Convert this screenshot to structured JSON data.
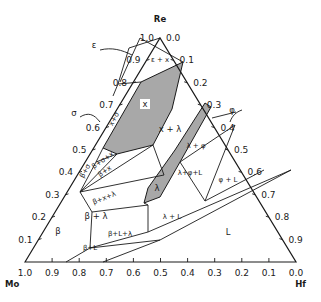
{
  "diagram": {
    "vertices": {
      "top": {
        "label": "Re",
        "x": 160,
        "y": 38
      },
      "left": {
        "label": "Mo",
        "x": 25,
        "y": 262
      },
      "right": {
        "label": "Hf",
        "x": 296,
        "y": 262
      }
    },
    "left_axis_ticks": [
      "1.0",
      "0.9",
      "0.8",
      "0.7",
      "0.6",
      "0.5",
      "0.4",
      "0.3",
      "0.2",
      "0.1"
    ],
    "right_axis_ticks": [
      "0.0",
      "0.1",
      "0.2",
      "0.3",
      "0.4",
      "0.5",
      "0.6",
      "0.7",
      "0.8",
      "0.9"
    ],
    "bottom_axis_ticks": [
      "1.0",
      "0.9",
      "0.8",
      "0.7",
      "0.6",
      "0.5",
      "0.4",
      "0.3",
      "0.2",
      "0.1",
      "0.0"
    ],
    "phase_labels": [
      {
        "id": "epsilon",
        "text": "ε",
        "x": 94,
        "y": 48
      },
      {
        "id": "epsilon-x",
        "text": "ε + x",
        "x": 160,
        "y": 62,
        "small": true
      },
      {
        "id": "x",
        "text": "x",
        "x": 145,
        "y": 107
      },
      {
        "id": "x-lambda",
        "text": "x + λ",
        "x": 170,
        "y": 132
      },
      {
        "id": "sigma",
        "text": "σ",
        "x": 74,
        "y": 116
      },
      {
        "id": "x-sigma",
        "text": "x+σ",
        "x": 116,
        "y": 120,
        "small": true,
        "rotate": -62
      },
      {
        "id": "beta-sigma",
        "text": "β+σ",
        "x": 87,
        "y": 172,
        "small": true,
        "rotate": -62
      },
      {
        "id": "beta-sigma-x",
        "text": "β+σ+x",
        "x": 104,
        "y": 162,
        "small": true,
        "rotate": -35
      },
      {
        "id": "beta-x",
        "text": "β+x",
        "x": 106,
        "y": 173,
        "small": true,
        "rotate": -35
      },
      {
        "id": "beta-x-lambda",
        "text": "β+x+λ",
        "x": 105,
        "y": 200,
        "small": true,
        "rotate": -22
      },
      {
        "id": "lambda",
        "text": "λ",
        "x": 157,
        "y": 191
      },
      {
        "id": "lambda-phi",
        "text": "λ + φ",
        "x": 196,
        "y": 148,
        "small": true
      },
      {
        "id": "phi",
        "text": "φ",
        "x": 232,
        "y": 113
      },
      {
        "id": "lambda-phi-L",
        "text": "λ+φ+L",
        "x": 190,
        "y": 175,
        "small": true
      },
      {
        "id": "phi-L",
        "text": "φ + L",
        "x": 228,
        "y": 182,
        "small": true
      },
      {
        "id": "beta-lambda",
        "text": "β + λ",
        "x": 96,
        "y": 219
      },
      {
        "id": "lambda-L",
        "text": "λ + L",
        "x": 172,
        "y": 219,
        "small": true
      },
      {
        "id": "beta",
        "text": "β",
        "x": 58,
        "y": 234
      },
      {
        "id": "beta-L-lambda",
        "text": "β+L+λ",
        "x": 120,
        "y": 236,
        "small": true
      },
      {
        "id": "beta-L",
        "text": "β+L",
        "x": 90,
        "y": 250,
        "small": true
      },
      {
        "id": "L",
        "text": "L",
        "x": 228,
        "y": 235
      }
    ],
    "shaded_regions": [
      {
        "id": "x-phase-region",
        "points": "141,82 183,62 172,109 153,145 117,154 103,148"
      },
      {
        "id": "lambda-phase-region",
        "points": "205,103 211,107 180,162 160,197 144,203 148,188 175,150"
      }
    ],
    "boundary_lines": [
      "129,48 160,38",
      "129,48 118,84",
      "140,38 183,62",
      "140,38 120,82",
      "118,84 141,82",
      "118,84 113,96",
      "103,148 96,162",
      "96,162 117,154",
      "96,162 80,192",
      "80,192 117,154",
      "80,192 153,145",
      "80,192 164,175",
      "80,192 92,212",
      "92,212 148,205",
      "153,145 164,175",
      "148,205 144,203",
      "92,212 90,248",
      "90,248 148,232",
      "148,205 148,232",
      "148,232 291,170",
      "90,248 160,240",
      "90,248 66,262",
      "160,240 103,262",
      "160,240 291,170",
      "212,118 236,112",
      "180,162 235,125",
      "180,162 205,201",
      "235,125 205,201",
      "205,201 264,170"
    ],
    "annotations": {
      "epsilon_arrow": "100,50 C 112,47 122,50 132,55",
      "sigma_arrow": "80,117 C 88,112 94,114 100,122",
      "phi_arrow": "242,110 C 236,112 232,116 230,122"
    }
  }
}
